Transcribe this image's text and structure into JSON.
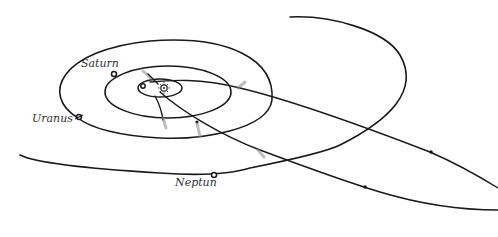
{
  "labels": {
    "saturn": "Saturn",
    "uranus": "Uranus",
    "neptune": "Neptun"
  },
  "colors": {
    "line": "#1a1a1a",
    "tail": "#888888",
    "label": "#333333",
    "background": "#ffffff"
  }
}
